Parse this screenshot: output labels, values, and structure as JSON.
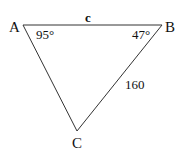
{
  "diagram": {
    "type": "triangle",
    "vertices": {
      "A": {
        "label": "A",
        "x": 23,
        "y": 25
      },
      "B": {
        "label": "B",
        "x": 162,
        "y": 25
      },
      "C": {
        "label": "C",
        "x": 77,
        "y": 131
      }
    },
    "side_labels": {
      "AB": "c",
      "BC": "160"
    },
    "angle_labels": {
      "A": "95°",
      "B": "47°"
    },
    "line_color": "#333333"
  }
}
